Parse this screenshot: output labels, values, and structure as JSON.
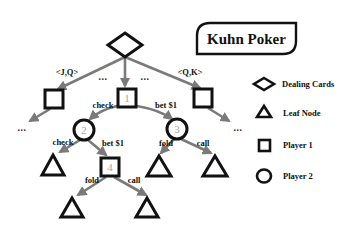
{
  "diagram": {
    "title": "Kuhn Poker",
    "colors": {
      "edge": "#7a7a7a",
      "node_stroke": "#111111",
      "node_number": "#a8a8a8",
      "background": "#ffffff"
    },
    "root": {
      "type": "dealing-cards",
      "shape": "diamond"
    },
    "deal_branches": [
      {
        "label": "<J,Q>"
      },
      {
        "label": "..."
      },
      {
        "label": "..."
      },
      {
        "label": "<Q,K>"
      }
    ],
    "nodes": [
      {
        "id": "1",
        "type": "player-1",
        "shape": "square",
        "number": "1"
      },
      {
        "id": "2",
        "type": "player-2",
        "shape": "circle",
        "number": "2"
      },
      {
        "id": "3",
        "type": "player-2",
        "shape": "circle",
        "number": "3"
      },
      {
        "id": "4",
        "type": "player-1",
        "shape": "square",
        "number": "4"
      }
    ],
    "edges": {
      "n1_check": "check",
      "n1_bet": "bet $1",
      "n2_check": "check",
      "n2_bet": "bet $1",
      "n3_fold": "fold",
      "n3_call": "call",
      "n4_fold": "fold",
      "n4_call": "call"
    },
    "ellipsis": "..."
  },
  "legend": {
    "items": [
      {
        "icon": "diamond-icon",
        "label": "Dealing Cards"
      },
      {
        "icon": "triangle-icon",
        "label": "Leaf Node"
      },
      {
        "icon": "square-icon",
        "label": "Player 1"
      },
      {
        "icon": "circle-icon",
        "label": "Player 2"
      }
    ]
  }
}
